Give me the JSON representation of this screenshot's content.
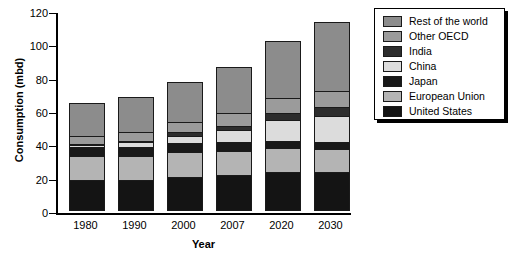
{
  "chart_data": {
    "type": "bar",
    "stacked": true,
    "title": "",
    "xlabel": "Year",
    "ylabel": "Consumption (mbd)",
    "categories": [
      "1980",
      "1990",
      "2000",
      "2007",
      "2020",
      "2030"
    ],
    "ylim": [
      0,
      120
    ],
    "yticks": [
      0,
      20,
      40,
      60,
      80,
      100,
      120
    ],
    "ytick_labels": [
      "0",
      "20",
      "40",
      "60",
      "80",
      "100",
      "120"
    ],
    "grid": false,
    "legend_position": "right",
    "totals": [
      63.5,
      67,
      76.5,
      85.5,
      101,
      112.5
    ],
    "series": [
      {
        "name": "United States",
        "color": "#141414",
        "values": [
          17.5,
          17.5,
          19.5,
          20.5,
          22,
          22.5
        ]
      },
      {
        "name": "European Union",
        "color": "#b4b4b4",
        "values": [
          14.5,
          14.5,
          14.5,
          14.5,
          14.5,
          13.5
        ]
      },
      {
        "name": "Japan",
        "color": "#191919",
        "values": [
          5,
          5.5,
          5.5,
          5,
          4.5,
          4.5
        ]
      },
      {
        "name": "China",
        "color": "#dcdcdc",
        "values": [
          1.5,
          2.5,
          4.5,
          7.5,
          12.5,
          15.5
        ]
      },
      {
        "name": "India",
        "color": "#2d2d2d",
        "values": [
          0.5,
          1,
          2,
          2.5,
          4,
          5
        ]
      },
      {
        "name": "Other OECD",
        "color": "#9b9b9b",
        "values": [
          4.5,
          5,
          6.5,
          7.5,
          9,
          10
        ]
      },
      {
        "name": "Rest of the world",
        "color": "#8c8c8c",
        "values": [
          20,
          21,
          24,
          28,
          34.5,
          41.5
        ]
      }
    ]
  },
  "legend": {
    "items": [
      {
        "label": "Rest of the world",
        "color": "#8c8c8c"
      },
      {
        "label": "Other OECD",
        "color": "#9b9b9b"
      },
      {
        "label": "India",
        "color": "#2d2d2d"
      },
      {
        "label": "China",
        "color": "#dcdcdc"
      },
      {
        "label": "Japan",
        "color": "#191919"
      },
      {
        "label": "European Union",
        "color": "#b4b4b4"
      },
      {
        "label": "United States",
        "color": "#141414"
      }
    ]
  }
}
